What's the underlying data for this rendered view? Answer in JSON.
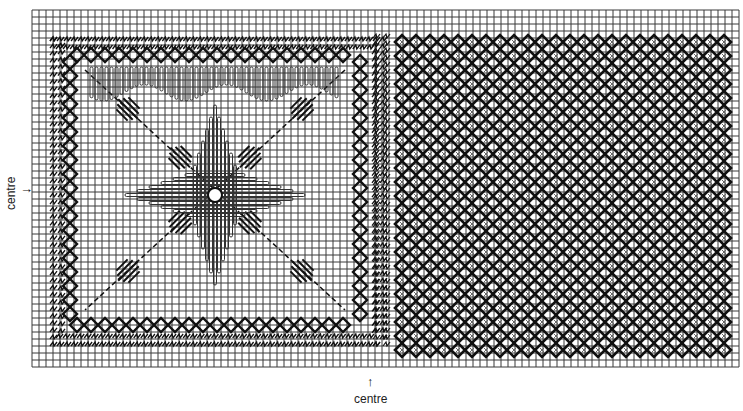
{
  "diagram": {
    "type": "needlework-chart",
    "grid": {
      "x0": 32,
      "y0": 10,
      "cell": 7,
      "cols": 101,
      "rows": 51,
      "line_color": "#3a3a3a",
      "background": "#ffffff"
    },
    "labels": {
      "left_centre": "centre",
      "bottom_centre": "centre",
      "left_arrow": "→",
      "bottom_arrow": "↑"
    },
    "sections": [
      {
        "name": "left-motif-square",
        "description": "Square motif with diamond-chain border, diagonal cross of bars, central star of satin stitches",
        "border": {
          "x": 70,
          "y": 55,
          "w": 290,
          "h": 270
        },
        "outer_fringe": {
          "x": 50,
          "y": 38,
          "w": 330,
          "h": 305
        }
      },
      {
        "name": "right-lattice-square",
        "description": "Dense diamond lattice fill",
        "area": {
          "x": 395,
          "y": 35,
          "w": 325,
          "h": 310
        }
      }
    ],
    "colors": {
      "ink": "#111111",
      "grid": "#3a3a3a"
    }
  }
}
